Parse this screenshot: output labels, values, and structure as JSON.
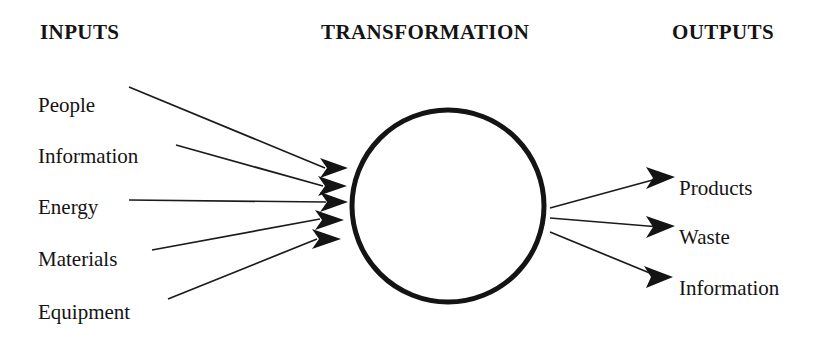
{
  "diagram": {
    "headings": {
      "inputs": "INPUTS",
      "transformation": "TRANSFORMATION",
      "outputs": "OUTPUTS"
    },
    "inputs": [
      {
        "label": "People",
        "y": 95
      },
      {
        "label": "Information",
        "y": 146
      },
      {
        "label": "Energy",
        "y": 197
      },
      {
        "label": "Materials",
        "y": 249
      },
      {
        "label": "Equipment",
        "y": 302
      }
    ],
    "outputs": [
      {
        "label": "Products",
        "y": 178
      },
      {
        "label": "Waste",
        "y": 227
      },
      {
        "label": "Information",
        "y": 278
      }
    ],
    "transformation": {
      "shape": "circle",
      "label": "",
      "center_x": 448,
      "center_y": 206,
      "radius": 96,
      "stroke_width": 5
    },
    "colors": {
      "background": "#ffffff",
      "ink": "#151515",
      "line": "#1b1b1b"
    }
  }
}
